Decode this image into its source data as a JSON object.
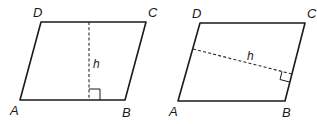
{
  "figures": [
    {
      "name": "parallelogram-vertical-height",
      "vertices": {
        "A": {
          "label": "A",
          "x": 20,
          "y": 100
        },
        "B": {
          "label": "B",
          "x": 125,
          "y": 100
        },
        "C": {
          "label": "C",
          "x": 146,
          "y": 22
        },
        "D": {
          "label": "D",
          "x": 41,
          "y": 22
        }
      },
      "height": {
        "label": "h",
        "from": [
          89,
          22
        ],
        "to": [
          89,
          100
        ],
        "base": "AB"
      }
    },
    {
      "name": "parallelogram-slanted-height",
      "vertices": {
        "A": {
          "label": "A",
          "x": 178,
          "y": 101
        },
        "B": {
          "label": "B",
          "x": 285,
          "y": 101
        },
        "C": {
          "label": "C",
          "x": 305,
          "y": 23
        },
        "D": {
          "label": "D",
          "x": 200,
          "y": 23
        }
      },
      "height": {
        "label": "h",
        "from": [
          193,
          49
        ],
        "to": [
          292,
          74
        ],
        "base": "BC"
      }
    }
  ],
  "colors": {
    "line": "#1a1a1a",
    "background": "#ffffff"
  }
}
